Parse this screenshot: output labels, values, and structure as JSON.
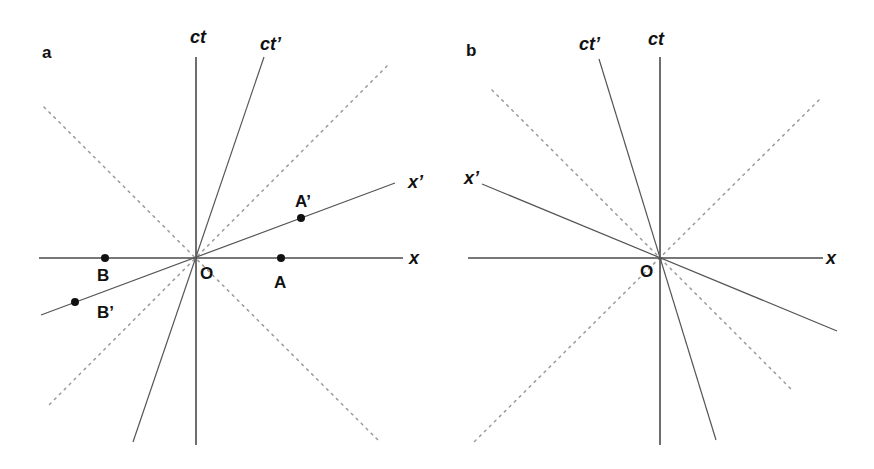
{
  "diagram": {
    "panels": [
      {
        "id": "a",
        "panel_label": "a",
        "axes": {
          "ct": "ct",
          "ct_prime": "ct’",
          "x": "x",
          "x_prime": "x’"
        },
        "origin_label": "O",
        "points": [
          {
            "label": "A",
            "on": "x"
          },
          {
            "label": "B",
            "on": "x"
          },
          {
            "label": "A’",
            "on": "x’"
          },
          {
            "label": "B’",
            "on": "x’"
          }
        ],
        "light_cone": "dashed diagonals"
      },
      {
        "id": "b",
        "panel_label": "b",
        "axes": {
          "ct": "ct",
          "ct_prime": "ct’",
          "x": "x",
          "x_prime": "x’"
        },
        "origin_label": "O",
        "points": [],
        "light_cone": "dashed diagonals"
      }
    ]
  }
}
